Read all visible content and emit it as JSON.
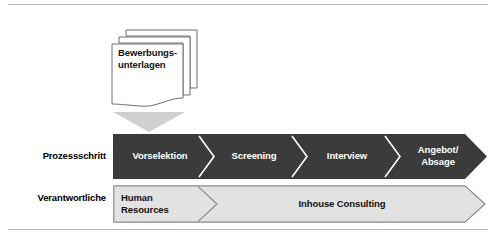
{
  "diagram": {
    "input_document": {
      "label_line1": "Bewerbungs-",
      "label_line2": "unterlagen",
      "icon": "document-stack-icon",
      "arrow_icon": "down-triangle-icon"
    },
    "rows": [
      {
        "label": "Prozessschritt",
        "style": "dark",
        "steps": [
          {
            "label": "Vorselektion"
          },
          {
            "label": "Screening"
          },
          {
            "label": "Interview"
          },
          {
            "label_line1": "Angebot/",
            "label_line2": "Absage"
          }
        ]
      },
      {
        "label": "Verantwortliche",
        "style": "light",
        "steps": [
          {
            "label_line1": "Human",
            "label_line2": "Resources"
          },
          {
            "label": "Inhouse Consulting"
          }
        ]
      }
    ],
    "colors": {
      "band_dark": "#3b3b3b",
      "band_light": "#e2e2e2",
      "band_light_border": "#8a8a8a",
      "rule": "#b8b8b8",
      "text_light": "#ffffff",
      "text_dark": "#111111",
      "triangle": "#d0d0d0"
    }
  }
}
